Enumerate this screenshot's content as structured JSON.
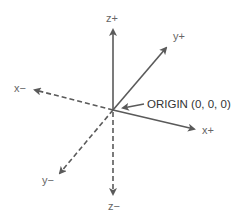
{
  "diagram": {
    "colors": {
      "axis": "#5a5a5a",
      "label": "#666666",
      "origin_label": "#333333",
      "background": "#ffffff"
    },
    "origin": {
      "label": "ORIGIN (0, 0, 0)",
      "x": 113,
      "y": 110
    },
    "axes": [
      {
        "name": "z+",
        "label": "z+",
        "style": "solid",
        "tip": [
          113,
          28
        ],
        "label_pos": [
          106,
          22
        ]
      },
      {
        "name": "y+",
        "label": "y+",
        "style": "solid",
        "tip": [
          168,
          46
        ],
        "label_pos": [
          173,
          40
        ]
      },
      {
        "name": "x+",
        "label": "x+",
        "style": "solid",
        "tip": [
          196,
          130
        ],
        "label_pos": [
          202,
          134
        ]
      },
      {
        "name": "x-",
        "label": "x−",
        "style": "dashed",
        "tip": [
          33,
          89
        ],
        "label_pos": [
          14,
          92
        ]
      },
      {
        "name": "y-",
        "label": "y−",
        "style": "dashed",
        "tip": [
          58,
          175
        ],
        "label_pos": [
          42,
          184
        ]
      },
      {
        "name": "z-",
        "label": "z−",
        "style": "dashed",
        "tip": [
          113,
          196
        ],
        "label_pos": [
          108,
          210
        ]
      }
    ]
  }
}
